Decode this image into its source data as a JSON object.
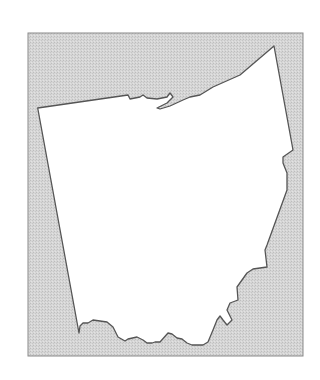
{
  "map": {
    "region": "Ohio",
    "style": "outline",
    "colors": {
      "background": "#ffffff",
      "frame_fill": "#d4d4d4",
      "frame_stroke": "#8a8a8a",
      "land_fill": "#ffffff",
      "outline_stroke": "#555555"
    },
    "frame": {
      "x": 28,
      "y": 33,
      "width": 275,
      "height": 323
    },
    "outline_points": "37.7,108 128,95 130,99 140,97 143,95 147,98 157,99 167,97 170,93 173,97 167,103 157,108 160,109 170,106 183,100 190,97 200,95 213,87 240,75 274,46 293,150 283,157 283,163 287,173 287,190 267,245 265,250 267,267 253,269 247,273 237,287 238,300 230,303 227,310 232,320 227,325 223,320 220,316 217,320 213,330 208,342 203,345 192,345 187,343 182,339 177,338 172,334 168,333 160,342 155,342 152,343 147,343 143,340 137,337 128,339 125,341 118,337 113,327 107,322 100,321 93,320 88,323 83,323 80,326 79,333"
  }
}
